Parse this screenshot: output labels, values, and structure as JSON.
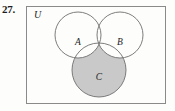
{
  "exercise": {
    "number_label": "27."
  },
  "figure": {
    "type": "venn-diagram",
    "universal_set_label": "U",
    "set_labels": [
      "A",
      "B",
      "C"
    ],
    "shaded_region_description": "C minus (A union B)",
    "colors": {
      "shading": "#c9c9c9",
      "stroke": "#6e6e6e",
      "frame_stroke": "#8a8a8a",
      "text": "#1c1c1c",
      "background": "#fdfdfc"
    },
    "frame": {
      "x": 26,
      "y": 6,
      "width": 140,
      "height": 98
    },
    "circles": [
      {
        "label": "A",
        "cx": 78,
        "cy": 35,
        "r": 23
      },
      {
        "label": "B",
        "cx": 120,
        "cy": 35,
        "r": 23
      },
      {
        "label": "C",
        "cx": 99,
        "cy": 70,
        "r": 27
      }
    ],
    "label_positions": {
      "U": {
        "x": 34,
        "y": 18
      },
      "A": {
        "x": 78,
        "y": 45
      },
      "B": {
        "x": 120,
        "y": 45
      },
      "C": {
        "x": 99,
        "y": 80
      }
    }
  }
}
